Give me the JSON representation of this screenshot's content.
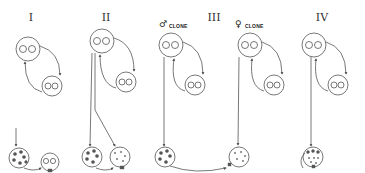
{
  "figure": {
    "panels": [
      {
        "label": "I",
        "x": 31
      },
      {
        "label": "II",
        "x": 106
      },
      {
        "label": "III",
        "x": 214
      },
      {
        "label": "IV",
        "x": 322
      }
    ],
    "clones": [
      {
        "sex_symbol": "♂",
        "text": "CLONE",
        "x": 159
      },
      {
        "sex_symbol": "♀",
        "text": "CLONE",
        "x": 256
      }
    ]
  },
  "colors": {
    "stroke": "#555555",
    "background": "#ffffff",
    "dots": "#555555"
  }
}
